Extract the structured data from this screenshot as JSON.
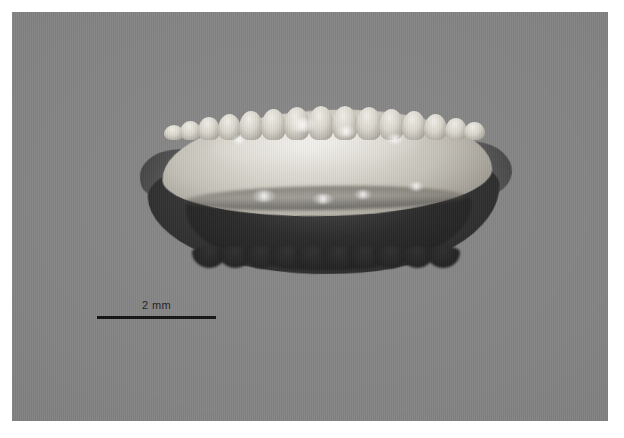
{
  "figure": {
    "kind": "macro-photograph",
    "view": "lateral / flat-lying view on plain backdrop",
    "background_color": "#848484",
    "plate_border_color": "#ffffff"
  },
  "scale_bar": {
    "label": "2 mm",
    "line_color": "#121212",
    "label_color": "#1c1c1c",
    "length_px": 119,
    "position": "lower-left"
  },
  "specimen": {
    "dorsal_margin": "crenulated / scalloped with rounded bumps",
    "ventral_margin": "dark shadowed, scalloped",
    "left_feature": "pointed rostrum",
    "right_feature": "pointed antirostrum",
    "surface": "translucent pale with specular highlights",
    "highlight_color": "#f0eee7",
    "body_color": "#d9d6cd",
    "shadow_color": "#242424"
  },
  "crenulations": {
    "dorsal": [
      {
        "left": 0,
        "width": 20,
        "height": 15
      },
      {
        "left": 16,
        "width": 21,
        "height": 19
      },
      {
        "left": 34,
        "width": 22,
        "height": 23
      },
      {
        "left": 54,
        "width": 23,
        "height": 26
      },
      {
        "left": 75,
        "width": 24,
        "height": 29
      },
      {
        "left": 97,
        "width": 25,
        "height": 31
      },
      {
        "left": 120,
        "width": 26,
        "height": 33
      },
      {
        "left": 144,
        "width": 26,
        "height": 34
      },
      {
        "left": 168,
        "width": 26,
        "height": 34
      },
      {
        "left": 192,
        "width": 26,
        "height": 33
      },
      {
        "left": 215,
        "width": 25,
        "height": 31
      },
      {
        "left": 238,
        "width": 24,
        "height": 29
      },
      {
        "left": 260,
        "width": 23,
        "height": 26
      },
      {
        "left": 281,
        "width": 22,
        "height": 22
      },
      {
        "left": 300,
        "width": 21,
        "height": 18
      }
    ],
    "ventral": [
      {
        "left": 0
      },
      {
        "left": 26
      },
      {
        "left": 52
      },
      {
        "left": 78
      },
      {
        "left": 104
      },
      {
        "left": 130
      },
      {
        "left": 156
      },
      {
        "left": 182
      },
      {
        "left": 208
      },
      {
        "left": 234
      }
    ]
  },
  "specular_highlights": [
    {
      "left": 150,
      "top": 28,
      "width": 26,
      "height": 14
    },
    {
      "left": 196,
      "top": 36,
      "width": 20,
      "height": 11
    },
    {
      "left": 246,
      "top": 44,
      "width": 18,
      "height": 10
    },
    {
      "left": 112,
      "top": 100,
      "width": 24,
      "height": 12
    },
    {
      "left": 172,
      "top": 104,
      "width": 22,
      "height": 10
    },
    {
      "left": 214,
      "top": 100,
      "width": 18,
      "height": 9
    },
    {
      "left": 268,
      "top": 92,
      "width": 16,
      "height": 9
    },
    {
      "left": 92,
      "top": 46,
      "width": 14,
      "height": 8
    }
  ]
}
